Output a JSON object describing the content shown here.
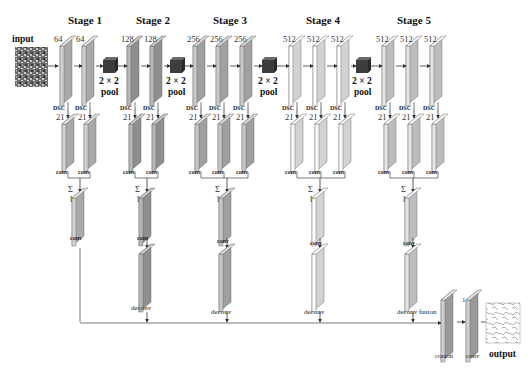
{
  "diagram": {
    "type": "neural-network-architecture",
    "input_label": "input",
    "output_label": "output",
    "fusion_label": "fusion",
    "concat_label": "concat",
    "final_conv_label": "conv",
    "final_conv_channels": "1",
    "pool_size": "2 × 2",
    "pool_label": "pool",
    "dsc_label": "DSC",
    "dsc_channels": "21",
    "conv_label": "conv",
    "sum_symbol": "Σ",
    "sum_channels": "1",
    "deconv_label": "deconv",
    "stages": [
      {
        "title": "Stage 1",
        "channels": [
          "64",
          "64"
        ],
        "color": "#a9a9a9"
      },
      {
        "title": "Stage 2",
        "channels": [
          "128",
          "128"
        ],
        "color": "#8f8f8f"
      },
      {
        "title": "Stage 3",
        "channels": [
          "256",
          "256",
          "256"
        ],
        "color": "#a0a0a0"
      },
      {
        "title": "Stage 4",
        "channels": [
          "512",
          "512",
          "512"
        ],
        "color": "#d2d2d2"
      },
      {
        "title": "Stage 5",
        "channels": [
          "512",
          "512",
          "512"
        ],
        "color": "#bdbdbd"
      }
    ],
    "colors": {
      "pool_block": "#3d3d3d",
      "line": "#444444",
      "text": "#111111"
    }
  }
}
